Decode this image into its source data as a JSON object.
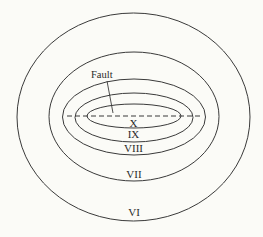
{
  "diagram": {
    "type": "isoseismal-map",
    "background": "#fbfbf7",
    "line_color": "#3a3a3a",
    "fault": {
      "label": "Fault",
      "style": "dashed"
    },
    "zones": [
      {
        "label": "VI"
      },
      {
        "label": "VII"
      },
      {
        "label": "VIII"
      },
      {
        "label": "IX"
      },
      {
        "label": "X"
      }
    ]
  }
}
